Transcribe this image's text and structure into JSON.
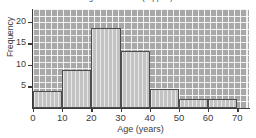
{
  "chart_data": {
    "type": "bar",
    "title": "Age Distribution (clipped)",
    "xlabel": "Age (years)",
    "ylabel": "Frequency",
    "categories": [
      "0-10",
      "10-20",
      "20-30",
      "30-40",
      "40-50",
      "50-60",
      "60-70"
    ],
    "bin_edges": [
      0,
      10,
      20,
      30,
      40,
      50,
      60,
      70
    ],
    "values": [
      4,
      8.8,
      18.5,
      13.2,
      4.5,
      2,
      2
    ],
    "xlim": [
      0,
      74
    ],
    "ylim": [
      0,
      23
    ],
    "xticks": [
      "0",
      "10",
      "20",
      "30",
      "40",
      "50",
      "60",
      "70"
    ],
    "xtick_values": [
      0,
      10,
      20,
      30,
      40,
      50,
      60,
      70
    ],
    "yticks": [
      "5",
      "10",
      "15",
      "20"
    ],
    "ytick_values": [
      5,
      10,
      15,
      20
    ],
    "grid": true,
    "legend": "none",
    "colors": {
      "bar_fill": "#c9c9c9",
      "bar_edge": "#4e4e4e",
      "plot_background": "#a8a8a8",
      "grid_line": "#ffffff",
      "axis": "#3a3a3a",
      "text": "#3d3d3d"
    }
  }
}
